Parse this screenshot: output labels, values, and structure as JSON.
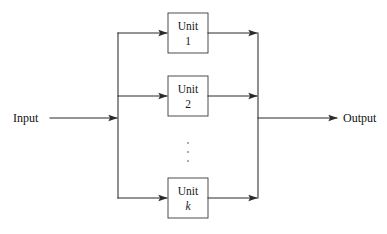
{
  "diagram": {
    "type": "block-diagram",
    "background_color": "#ffffff",
    "line_color": "#2b2b2b",
    "box_stroke_color": "#3a3a3a",
    "text_color": "#1a1a1a",
    "input": {
      "label": "Input",
      "label_x": 13,
      "label_y": 122,
      "arrow_from_x": 50,
      "arrow_to_x": 118,
      "y": 118
    },
    "output": {
      "label": "Output",
      "label_x": 343,
      "label_y": 122,
      "arrow_from_x": 258,
      "arrow_to_x": 338,
      "y": 118
    },
    "left_bus": {
      "x": 118,
      "y_top": 33,
      "y_bottom": 198
    },
    "right_bus": {
      "x": 258,
      "y_top": 33,
      "y_bottom": 198
    },
    "units": [
      {
        "name": "Unit",
        "index": "1",
        "index_style": "roman",
        "box": {
          "x": 168,
          "y": 13,
          "width": 40,
          "height": 40
        },
        "center_y": 33,
        "in_arrow_from_x": 118,
        "in_arrow_to_x": 168,
        "out_line_from_x": 208,
        "out_arrow_to_x": 258
      },
      {
        "name": "Unit",
        "index": "2",
        "index_style": "roman",
        "box": {
          "x": 168,
          "y": 76,
          "width": 40,
          "height": 40
        },
        "center_y": 96,
        "in_arrow_from_x": 118,
        "in_arrow_to_x": 168,
        "out_line_from_x": 208,
        "out_arrow_to_x": 258
      },
      {
        "name": "Unit",
        "index": "k",
        "index_style": "italic",
        "box": {
          "x": 168,
          "y": 178,
          "width": 40,
          "height": 40
        },
        "center_y": 198,
        "in_arrow_from_x": 118,
        "in_arrow_to_x": 168,
        "out_line_from_x": 208,
        "out_arrow_to_x": 258
      }
    ],
    "ellipsis": {
      "symbol": "vertical-ellipsis",
      "x": 188,
      "dots_y": [
        143,
        152,
        161
      ],
      "dot_radius": 1.1
    }
  }
}
